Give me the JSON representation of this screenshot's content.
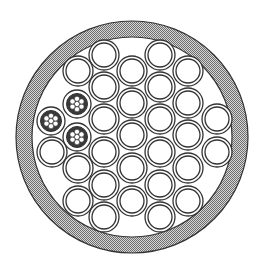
{
  "diagram": {
    "type": "cable-cross-section",
    "colors": {
      "background": "#ffffff",
      "stroke": "#333333",
      "jacket_fill": "#8a8a8a",
      "jacket_light": "#d8d8d8"
    },
    "jacket": {
      "cx": 132,
      "cy": 137,
      "outer_r": 116,
      "inner_r": 100
    },
    "conductor": {
      "outer_r": 15,
      "inner_r": 12
    },
    "stranded": {
      "outer_r": 14,
      "inner_r": 10.5,
      "strand_r": 2.6,
      "strand_offset": 5.2
    },
    "solid_conductors": [
      [
        104,
        55
      ],
      [
        160,
        55
      ],
      [
        78,
        71
      ],
      [
        132,
        71
      ],
      [
        188,
        71
      ],
      [
        104,
        87
      ],
      [
        160,
        87
      ],
      [
        132,
        103
      ],
      [
        188,
        103
      ],
      [
        104,
        119
      ],
      [
        160,
        119
      ],
      [
        217,
        119
      ],
      [
        132,
        135
      ],
      [
        188,
        135
      ],
      [
        52,
        152
      ],
      [
        104,
        152
      ],
      [
        160,
        152
      ],
      [
        217,
        152
      ],
      [
        78,
        168
      ],
      [
        132,
        168
      ],
      [
        188,
        168
      ],
      [
        104,
        185
      ],
      [
        160,
        185
      ],
      [
        78,
        201
      ],
      [
        132,
        201
      ],
      [
        188,
        201
      ],
      [
        104,
        217
      ],
      [
        160,
        217
      ]
    ],
    "stranded_conductors": [
      [
        77,
        104
      ],
      [
        51,
        121
      ],
      [
        77,
        137
      ]
    ]
  }
}
